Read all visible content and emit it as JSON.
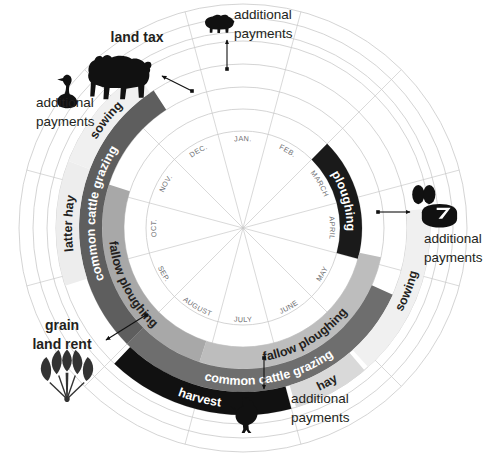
{
  "diagram": {
    "center": {
      "x": 243,
      "y": 228
    },
    "months": [
      {
        "abbr": "JAN.",
        "index": 0
      },
      {
        "abbr": "FEB.",
        "index": 1
      },
      {
        "abbr": "MARCH",
        "index": 2
      },
      {
        "abbr": "APRIL",
        "index": 3
      },
      {
        "abbr": "MAY",
        "index": 4
      },
      {
        "abbr": "JUNE",
        "index": 5
      },
      {
        "abbr": "JULY",
        "index": 6
      },
      {
        "abbr": "AUGUST",
        "index": 7
      },
      {
        "abbr": "SEP.",
        "index": 8
      },
      {
        "abbr": "OCT.",
        "index": 9
      },
      {
        "abbr": "NOV.",
        "index": 10
      },
      {
        "abbr": "DEC.",
        "index": 11
      }
    ],
    "rings": [
      {
        "name": "ploughing-ring",
        "r_inner": 97,
        "r_outer": 119,
        "segments": [
          {
            "label": "ploughing",
            "start_month": 2.0,
            "end_month": 4.0,
            "color": "#1a1a1a",
            "text_color": "light"
          }
        ]
      },
      {
        "name": "fallow-ploughing-ring",
        "r_inner": 119,
        "r_outer": 141,
        "segments": [
          {
            "label": "fallow ploughing",
            "start_month": 3.9,
            "end_month": 7.1,
            "color": "#bdbdbd",
            "text_color": "dark"
          },
          {
            "label": "fallow ploughing",
            "start_month": 7.1,
            "end_month": 10.1,
            "color": "#a8a8a8",
            "text_color": "dark"
          }
        ]
      },
      {
        "name": "common-cattle-grazing-ring",
        "r_inner": 141,
        "r_outer": 164,
        "segments": [
          {
            "label": "common cattle grazing",
            "start_month": 4.3,
            "end_month": 8.0,
            "color": "#6e6e6e",
            "text_color": "light"
          },
          {
            "label": "common cattle grazing",
            "start_month": 8.0,
            "end_month": 11.4,
            "color": "#5e5e5e",
            "text_color": "light"
          }
        ]
      },
      {
        "name": "harvest-sowing-ring",
        "r_inner": 164,
        "r_outer": 187,
        "segments": [
          {
            "label": "hay",
            "start_month": 5.15,
            "end_month": 5.95,
            "color": "#d9d9d9",
            "text_color": "dark"
          },
          {
            "label": "sowing",
            "start_month": 3.3,
            "end_month": 5.1,
            "color": "#f0f0f0",
            "text_color": "dark"
          },
          {
            "label": "harvest",
            "start_month": 6.0,
            "end_month": 7.95,
            "color": "#111111",
            "text_color": "light"
          },
          {
            "label": "latter hay",
            "start_month": 8.9,
            "end_month": 10.2,
            "color": "#ededed",
            "text_color": "dark"
          },
          {
            "label": "sowing",
            "start_month": 10.2,
            "end_month": 11.35,
            "color": "#f0f0f0",
            "text_color": "dark"
          }
        ]
      }
    ],
    "outer_guide_radii": [
      196,
      210,
      224
    ],
    "annotations": [
      {
        "id": "land-tax",
        "lines": [
          "land tax"
        ],
        "style": "bold",
        "icon": "cow-icon",
        "text_x": 137,
        "text_y": 42,
        "align": "middle"
      },
      {
        "id": "additional-payments-left",
        "lines": [
          "additional",
          "payments"
        ],
        "style": "normal",
        "icon": "goose-icon",
        "text_x": 36,
        "text_y": 107,
        "align": "start"
      },
      {
        "id": "additional-payments-top",
        "lines": [
          "additional",
          "payments"
        ],
        "style": "normal",
        "icon": "pig-icon",
        "text_x": 234,
        "text_y": 19,
        "align": "start"
      },
      {
        "id": "additional-payments-right",
        "lines": [
          "additional",
          "payments"
        ],
        "style": "normal",
        "icon": "eggs-cheese-icon",
        "text_x": 424,
        "text_y": 243,
        "align": "start"
      },
      {
        "id": "additional-payments-bottom",
        "lines": [
          "additional",
          "payments"
        ],
        "style": "normal",
        "icon": "chicken-icon",
        "text_x": 291,
        "text_y": 403,
        "align": "start"
      },
      {
        "id": "grain-land-rent",
        "lines": [
          "grain",
          "land rent"
        ],
        "style": "bold",
        "icon": "wheat-sheaf-icon",
        "text_x": 62,
        "text_y": 330,
        "align": "middle"
      }
    ],
    "colors": {
      "black_band": "#111111",
      "dark_gray_band": "#5e5e5e",
      "mid_gray_band": "#6e6e6e",
      "light_gray_band": "#bdbdbd",
      "pale_band": "#f0f0f0",
      "guide_line": "#c9c9c9",
      "text": "#231f20",
      "month_text": "#6d6e71"
    }
  }
}
